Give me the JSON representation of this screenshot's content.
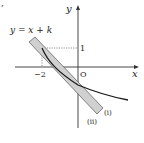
{
  "corner_mark": ",",
  "axes": {
    "x_label": "x",
    "y_label": "y",
    "origin_label": "O",
    "tick_x_label": "−2",
    "tick_y_label": "1"
  },
  "line_label": "y = x + k",
  "curve_labels": {
    "first": "(ⅰ)",
    "second": "(ⅱ)"
  },
  "colors": {
    "axis": "#333333",
    "curve": "#1a1a1a",
    "band_fill": "#d0d0d0",
    "band_edge": "#555555",
    "dotted": "#777777"
  }
}
